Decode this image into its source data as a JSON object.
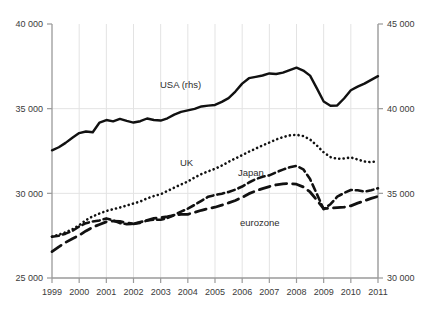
{
  "chart_data": {
    "type": "line",
    "title": "",
    "subtitle": "",
    "xlabel": "",
    "ylabel": "",
    "grid": "vertical-and-horizontal",
    "legend_position": "inline-annotations",
    "x": [
      1999,
      1999.25,
      1999.5,
      1999.75,
      2000,
      2000.25,
      2000.5,
      2000.75,
      2001,
      2001.25,
      2001.5,
      2001.75,
      2002,
      2002.25,
      2002.5,
      2002.75,
      2003,
      2003.25,
      2003.5,
      2003.75,
      2004,
      2004.25,
      2004.5,
      2004.75,
      2005,
      2005.25,
      2005.5,
      2005.75,
      2006,
      2006.25,
      2006.5,
      2006.75,
      2007,
      2007.25,
      2007.5,
      2007.75,
      2008,
      2008.25,
      2008.5,
      2008.75,
      2009,
      2009.25,
      2009.5,
      2009.75,
      2010,
      2010.25,
      2010.5,
      2010.75,
      2011
    ],
    "xticks": [
      1999,
      2000,
      2001,
      2002,
      2003,
      2004,
      2005,
      2006,
      2007,
      2008,
      2009,
      2010,
      2011
    ],
    "xticklabels": [
      "1999",
      "2000",
      "2001",
      "2002",
      "2003",
      "2004",
      "2005",
      "2006",
      "2007",
      "2008",
      "2009",
      "2010",
      "2011"
    ],
    "xlim": [
      1999,
      2011
    ],
    "left_axis": {
      "label": "",
      "ticks": [
        25000,
        30000,
        35000,
        40000
      ],
      "ticklabels": [
        "25 000",
        "30 000",
        "35 000",
        "40 000"
      ],
      "lim": [
        25000,
        40000
      ]
    },
    "right_axis": {
      "label": "",
      "ticks": [
        30000,
        35000,
        40000,
        45000
      ],
      "ticklabels": [
        "30 000",
        "35 000",
        "40 000",
        "45 000"
      ],
      "lim": [
        30000,
        45000
      ]
    },
    "series": [
      {
        "name": "USA (rhs)",
        "axis": "right",
        "style": "solid",
        "annotation": {
          "text": "USA (rhs)",
          "x": 160,
          "y": 88
        },
        "values": [
          37540,
          37720,
          37980,
          38280,
          38560,
          38650,
          38610,
          39180,
          39330,
          39250,
          39400,
          39280,
          39180,
          39260,
          39420,
          39330,
          39300,
          39430,
          39650,
          39810,
          39900,
          39990,
          40130,
          40180,
          40220,
          40400,
          40620,
          41010,
          41480,
          41800,
          41880,
          41960,
          42080,
          42050,
          42130,
          42280,
          42420,
          42250,
          41950,
          41200,
          40420,
          40170,
          40190,
          40600,
          41090,
          41300,
          41480,
          41700,
          41920
        ]
      },
      {
        "name": "UK",
        "axis": "left",
        "style": "dotted",
        "annotation": {
          "text": "UK",
          "x": 180,
          "y": 166
        },
        "values": [
          27440,
          27560,
          27700,
          27880,
          28120,
          28420,
          28640,
          28810,
          28960,
          29060,
          29160,
          29280,
          29400,
          29520,
          29700,
          29840,
          29950,
          30140,
          30340,
          30520,
          30700,
          30940,
          31140,
          31300,
          31450,
          31640,
          31860,
          32060,
          32260,
          32460,
          32640,
          32830,
          33000,
          33180,
          33320,
          33420,
          33460,
          33380,
          33180,
          32820,
          32420,
          32140,
          32040,
          32060,
          32120,
          32000,
          31880,
          31840,
          31900
        ]
      },
      {
        "name": "Japan",
        "axis": "left",
        "style": "dashed",
        "annotation": {
          "text": "Japan",
          "x": 238,
          "y": 176
        },
        "values": [
          27440,
          27500,
          27620,
          27780,
          28040,
          28240,
          28340,
          28400,
          28520,
          28400,
          28240,
          28180,
          28200,
          28300,
          28400,
          28440,
          28440,
          28540,
          28720,
          28920,
          29100,
          29320,
          29560,
          29800,
          29900,
          29980,
          30080,
          30220,
          30400,
          30640,
          30840,
          30980,
          31060,
          31240,
          31400,
          31540,
          31620,
          31420,
          30840,
          29960,
          29060,
          29360,
          29800,
          30020,
          30200,
          30180,
          30100,
          30180,
          30300
        ]
      },
      {
        "name": "eurozone",
        "axis": "left",
        "style": "long-dashed",
        "annotation": {
          "text": "eurozone",
          "x": 240,
          "y": 226
        },
        "values": [
          26560,
          26840,
          27100,
          27320,
          27520,
          27780,
          28000,
          28160,
          28320,
          28360,
          28340,
          28260,
          28200,
          28260,
          28400,
          28520,
          28560,
          28620,
          28700,
          28760,
          28760,
          28880,
          29000,
          29100,
          29180,
          29300,
          29440,
          29580,
          29760,
          29980,
          30140,
          30280,
          30400,
          30500,
          30560,
          30580,
          30540,
          30380,
          30080,
          29600,
          29100,
          29120,
          29160,
          29180,
          29260,
          29420,
          29560,
          29700,
          29820
        ]
      }
    ]
  }
}
